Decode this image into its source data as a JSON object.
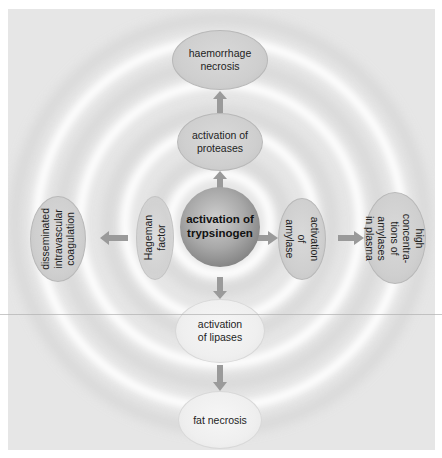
{
  "diagram": {
    "center": {
      "label": "activation of\ntrypsinogen"
    },
    "up": [
      {
        "label": "activation of\nproteases"
      },
      {
        "label": "haemorrhage\nnecrosis"
      }
    ],
    "down": [
      {
        "label": "activation\nof lipases"
      },
      {
        "label": "fat necrosis"
      }
    ],
    "left": [
      {
        "label": "Hageman\nfactor"
      },
      {
        "label": "disseminated\nintravascular\ncoagulation"
      }
    ],
    "right": [
      {
        "label": "activation of\namylase"
      },
      {
        "label": "high concentra-\ntions of amylases\nin plasma"
      }
    ],
    "colors": {
      "background": "#e6e6e6",
      "ring_highlight": "#ffffff",
      "arrow": "#9a9a9a",
      "center_sphere": "#8a8a8a",
      "node_grey": "#cfcfcf",
      "node_light": "#efefef"
    }
  }
}
